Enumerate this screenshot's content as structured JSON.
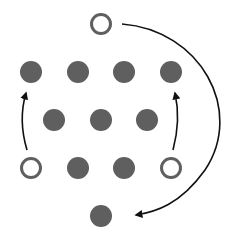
{
  "diagram": {
    "colors": {
      "filled": "#5f5f5f",
      "open_stroke": "#5f5f5f",
      "arrow": "#111111",
      "background": "#ffffff"
    },
    "radius": 11,
    "nodes": [
      {
        "id": "top",
        "x": 101,
        "y": 24,
        "type": "open"
      },
      {
        "id": "r1c1",
        "x": 31,
        "y": 72,
        "type": "filled"
      },
      {
        "id": "r1c2",
        "x": 78,
        "y": 72,
        "type": "filled"
      },
      {
        "id": "r1c3",
        "x": 124,
        "y": 72,
        "type": "filled"
      },
      {
        "id": "r1c4",
        "x": 171,
        "y": 72,
        "type": "filled"
      },
      {
        "id": "r2c1",
        "x": 54,
        "y": 120,
        "type": "filled"
      },
      {
        "id": "r2c2",
        "x": 101,
        "y": 120,
        "type": "filled"
      },
      {
        "id": "r2c3",
        "x": 147,
        "y": 120,
        "type": "filled"
      },
      {
        "id": "r3c1",
        "x": 31,
        "y": 168,
        "type": "open"
      },
      {
        "id": "r3c2",
        "x": 78,
        "y": 168,
        "type": "filled"
      },
      {
        "id": "r3c3",
        "x": 124,
        "y": 168,
        "type": "filled"
      },
      {
        "id": "r3c4",
        "x": 171,
        "y": 168,
        "type": "open"
      },
      {
        "id": "bottom",
        "x": 101,
        "y": 216,
        "type": "filled"
      }
    ],
    "arrows": [
      {
        "id": "left-arrow",
        "from": "r3c1",
        "to": "r1c1",
        "d": "M27,150 Q18,120 26,93"
      },
      {
        "id": "right-arrow",
        "from": "r3c4",
        "to": "r1c4",
        "d": "M173,150 Q181,120 175,93"
      },
      {
        "id": "big-arc-arrow",
        "from": "top",
        "to": "bottom",
        "d": "M122,24 C200,30 245,110 205,170 C180,205 155,212 136,215"
      }
    ]
  }
}
